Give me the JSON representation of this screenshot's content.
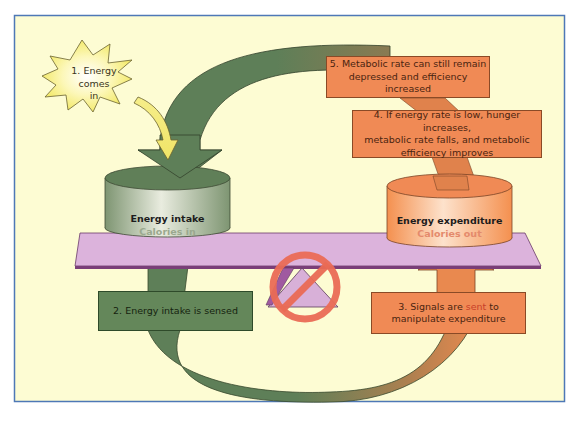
{
  "diagram": {
    "colors": {
      "background": "#fdfcd3",
      "frame_border": "#4e78b6",
      "green_arrow": "#5e7f58",
      "orange": "#f08a55",
      "beam": "#dcb3dc",
      "beam_edge": "#7a3e78",
      "no_sign": "#ea6b55",
      "star": "#fbf49a"
    },
    "star": {
      "line1": "1. Energy comes",
      "line2": "in"
    },
    "intake": {
      "title": "Energy intake",
      "subtitle": "Calories in"
    },
    "expenditure": {
      "title": "Energy expenditure",
      "subtitle": "Calories out"
    },
    "steps": {
      "step2": "2. Energy intake is sensed",
      "step3_prefix": "3. Signals are ",
      "step3_highlight": "sent",
      "step3_suffix": " to",
      "step3_line2": "manipulate expenditure",
      "step4_line1": "4. If energy rate is low, hunger increases,",
      "step4_line2": "metabolic rate falls, and metabolic",
      "step4_line3": "efficiency improves",
      "step5_line1": "5. Metabolic rate can still remain",
      "step5_line2": "depressed and efficiency increased"
    },
    "icons": {
      "fulcrum": "triangle-fulcrum",
      "prohibited": "no-entry-sign"
    }
  }
}
